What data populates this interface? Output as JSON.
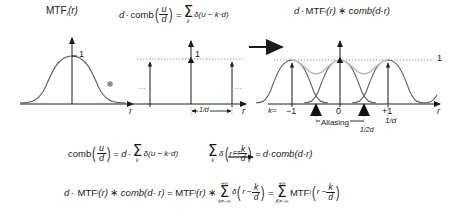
{
  "figure": {
    "type": "diagram",
    "panels": [
      {
        "id": "left",
        "title_main": "MTF",
        "title_sub": "i",
        "title_arg": "(r)",
        "peak_label": "1",
        "x_axis_label": "r",
        "curve": "gaussian-mtf"
      },
      {
        "id": "middle",
        "title": "d · comb(u/d) = ∑ₖ δ(u − k·d)",
        "title_lead": "d",
        "title_dot": "·",
        "title_comb": "comb",
        "title_frac_num": "u",
        "title_frac_den": "d",
        "title_eq": "=",
        "title_sum_sub": "k",
        "title_delta": "δ(u − k·d)",
        "peak_label": "1",
        "x_axis_label": "r",
        "spacing_label": "1/d",
        "ellipsis_left": "…",
        "ellipsis_right": "…"
      },
      {
        "id": "right",
        "title_lead": "d",
        "title_dot": "·",
        "title_mtf": "MTF",
        "title_sub": "i",
        "title_arg": "(r)",
        "title_conv": "∗",
        "title_comb": "comb(d·r)",
        "peak_label": "1",
        "x_axis_label": "r",
        "k_label": "k=",
        "tick_minus1": "−1",
        "tick_zero": "0",
        "tick_plus1": "+1",
        "aliasing_label": "Aliasing",
        "half_spacing_label": "1/2d",
        "spacing_label": "1/d"
      }
    ],
    "conv_symbol": "∗",
    "arrow": "→",
    "equations": [
      {
        "id": "eq1",
        "text": "comb(u/d) = d · ∑ₖ δ(u − k·d) —FT→ ∑ₖ δ(r − k/d) = d · comb(d·r)",
        "parts": {
          "comb": "comb",
          "frac_num": "u",
          "frac_den": "d",
          "eq": "=",
          "d": "d",
          "dot": "·",
          "sum_sub": "k",
          "delta_arg": "δ(u − k·d)",
          "ft_label": "FT",
          "delta2": "δ",
          "r_minus": "r −",
          "frac2_num": "k",
          "frac2_den": "d",
          "eq2": "=",
          "rhs": "d·comb(d·r)"
        }
      },
      {
        "id": "eq2",
        "text": "d · MTF_i(r) ∗ comb(d·r) = MTF_i(r) ∗ ∑ δ(r − k/d) = ∑ MTF_i(r − k/d)",
        "parts": {
          "d": "d",
          "dot": "·",
          "mtf": "MTF",
          "sub": "i",
          "arg": "(r)",
          "conv": "∗",
          "comb": "comb(d· r)",
          "eq": "=",
          "mtf2": "MTF",
          "sub2": "i",
          "arg2": "(r)",
          "conv2": "∗",
          "sum_top": "+∞",
          "sum_bot": "k=−∞",
          "delta": "δ",
          "r_minus": "r −",
          "frac_num": "k",
          "frac_den": "d",
          "eq2": "=",
          "sum2_top": "+∞",
          "sum2_bot": "K=−∞",
          "mtf3": "MTF",
          "sub3": "I",
          "r_minus2": "r −",
          "frac2_num": "k",
          "frac2_den": "d"
        }
      }
    ],
    "colors": {
      "ink": "#1a1a1a",
      "curve": "#4a4a4a",
      "ghost": "#b8b8b8",
      "dotted": "#8a8a8a",
      "background": "#ffffff"
    }
  }
}
